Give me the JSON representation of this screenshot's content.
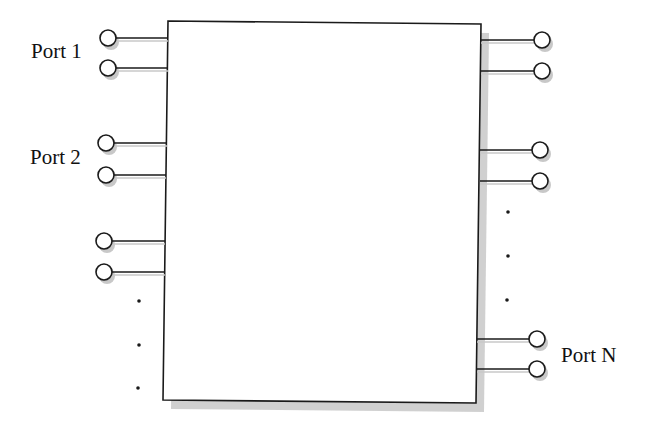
{
  "diagram": {
    "colors": {
      "line": "#1a1a1a",
      "shadow": "#c8c8c8",
      "background": "#ffffff"
    },
    "box": {
      "corners": [
        [
          168,
          21
        ],
        [
          481,
          24
        ],
        [
          476,
          403
        ],
        [
          163,
          400
        ]
      ],
      "shadow_offset": [
        8,
        9
      ]
    },
    "ports": [
      {
        "label": "Port 1",
        "side": "left",
        "label_pos": [
          31,
          41
        ],
        "terminals": [
          {
            "cx": 108,
            "cy": 38,
            "edge_x": 168
          },
          {
            "cx": 108,
            "cy": 68,
            "edge_x": 168
          }
        ]
      },
      {
        "label": "Port 2",
        "side": "left",
        "label_pos": [
          30,
          147
        ],
        "terminals": [
          {
            "cx": 106,
            "cy": 143,
            "edge_x": 167
          },
          {
            "cx": 106,
            "cy": 175,
            "edge_x": 166
          }
        ]
      },
      {
        "label": "",
        "side": "left",
        "terminals": [
          {
            "cx": 104,
            "cy": 241,
            "edge_x": 165
          },
          {
            "cx": 104,
            "cy": 272,
            "edge_x": 165
          }
        ]
      },
      {
        "label": "",
        "side": "right",
        "terminals": [
          {
            "cx": 542,
            "cy": 40,
            "edge_x": 481
          },
          {
            "cx": 542,
            "cy": 71,
            "edge_x": 481
          }
        ]
      },
      {
        "label": "",
        "side": "right",
        "terminals": [
          {
            "cx": 540,
            "cy": 150,
            "edge_x": 480
          },
          {
            "cx": 540,
            "cy": 181,
            "edge_x": 480
          }
        ]
      },
      {
        "label": "Port N",
        "side": "right",
        "label_pos": [
          561,
          345
        ],
        "terminals": [
          {
            "cx": 537,
            "cy": 339,
            "edge_x": 477
          },
          {
            "cx": 537,
            "cy": 369,
            "edge_x": 477
          }
        ]
      }
    ],
    "ellipsis_dots": {
      "left": [
        [
          139,
          301
        ],
        [
          139,
          345
        ],
        [
          138,
          388
        ]
      ],
      "right": [
        [
          508,
          212
        ],
        [
          508,
          256
        ],
        [
          507,
          300
        ]
      ]
    },
    "terminal_radius": 8
  }
}
